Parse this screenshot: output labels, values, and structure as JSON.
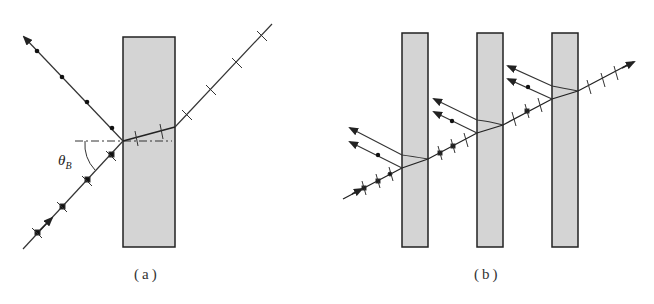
{
  "figure": {
    "panel_a": {
      "label": "(a)",
      "angle_label": "θ",
      "angle_subscript": "B",
      "slab": {
        "x": 123,
        "y": 37,
        "w": 52,
        "h": 210
      },
      "description": "Light incident at Brewster angle on glass plate; reflected ray polarized perpendicular (dots), transmitted ray with parallel component (ticks)"
    },
    "panel_b": {
      "label": "(b)",
      "slabs": [
        {
          "x": 402,
          "y": 33,
          "w": 26,
          "h": 214
        },
        {
          "x": 477,
          "y": 33,
          "w": 26,
          "h": 214
        },
        {
          "x": 552,
          "y": 33,
          "w": 26,
          "h": 214
        }
      ],
      "description": "Pile of plates polarizer: repeated reflections remove perpendicular component, transmitted beam increasingly polarized"
    },
    "colors": {
      "slab_fill": "#d4d4d4",
      "stroke": "#333333"
    }
  }
}
